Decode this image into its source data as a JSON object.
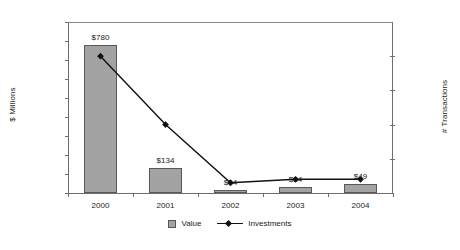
{
  "chart_data": {
    "type": "bar",
    "title": "",
    "categories": [
      "2000",
      "2001",
      "2002",
      "2003",
      "2004"
    ],
    "series": [
      {
        "name": "Value",
        "type": "bar",
        "axis": "left",
        "values": [
          780,
          134,
          14,
          34,
          49
        ],
        "data_labels": [
          "$780",
          "$134",
          "$14",
          "$34",
          "$49"
        ],
        "color": "#a3a3a3"
      },
      {
        "name": "Investments",
        "type": "line",
        "axis": "right",
        "values": [
          40,
          20,
          3,
          4,
          4
        ],
        "color": "#111111",
        "marker": "diamond"
      }
    ],
    "xlabel": "",
    "ylabel": "$ Millions",
    "ylabel_right": "# Transactions",
    "ylim": [
      0,
      900
    ],
    "ylim_right": [
      0,
      50
    ],
    "ytick_labels": [
      "$900",
      "$800",
      "$700",
      "$600",
      "$500",
      "$400",
      "$300",
      "$200",
      "$100",
      "$0"
    ],
    "ytick_values": [
      900,
      800,
      700,
      600,
      500,
      400,
      300,
      200,
      100,
      0
    ],
    "ytick_right_labels": [
      "50",
      "40",
      "30",
      "20",
      "10",
      "0"
    ],
    "ytick_right_values": [
      50,
      40,
      30,
      20,
      10,
      0
    ],
    "grid": false,
    "legend_position": "bottom",
    "legend": [
      "Value",
      "Investments"
    ]
  }
}
